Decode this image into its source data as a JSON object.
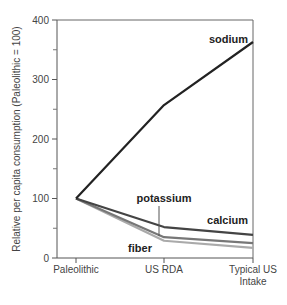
{
  "chart_data": {
    "type": "line",
    "title": "",
    "xlabel": "",
    "ylabel": "Relative per capita consumption (Paleolithic = 100)",
    "ylim": [
      0,
      400
    ],
    "yticks": [
      0,
      100,
      200,
      300,
      400
    ],
    "yminor_ticks": [
      50,
      150,
      250,
      350
    ],
    "grid": false,
    "legend": "inline labels",
    "categories": [
      "Paleolithic",
      "US RDA",
      "Typical US Intake"
    ],
    "category_labels": [
      [
        "Paleolithic"
      ],
      [
        "US RDA"
      ],
      [
        "Typical US",
        "Intake"
      ]
    ],
    "series": [
      {
        "name": "sodium",
        "values": [
          100,
          257,
          363
        ],
        "color": "#222222"
      },
      {
        "name": "calcium",
        "values": [
          100,
          52,
          39
        ],
        "color": "#444444"
      },
      {
        "name": "potassium",
        "values": [
          100,
          35,
          25
        ],
        "color": "#777777"
      },
      {
        "name": "fiber",
        "values": [
          100,
          29,
          17
        ],
        "color": "#aaaaaa"
      }
    ]
  }
}
